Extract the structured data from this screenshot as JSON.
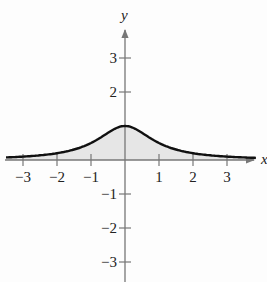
{
  "chart_data": {
    "type": "area",
    "title": "",
    "xlabel": "x",
    "ylabel": "y",
    "function": "y = 1/(1+x^2)",
    "xlim": [
      -3.5,
      3.8
    ],
    "ylim": [
      -3.6,
      3.8
    ],
    "x_ticks": [
      -3,
      -2,
      -1,
      1,
      2,
      3
    ],
    "x_tick_labels": [
      "−3",
      "−2",
      "−1",
      "1",
      "2",
      "3"
    ],
    "y_ticks": [
      3,
      2,
      -1,
      -2,
      -3
    ],
    "y_tick_labels": [
      "3",
      "2",
      "−1",
      "−2",
      "−3"
    ],
    "grid": false,
    "legend": null,
    "series": [
      {
        "name": "curve",
        "x": [
          -3.5,
          -3,
          -2.5,
          -2,
          -1.5,
          -1,
          -0.5,
          0,
          0.5,
          1,
          1.5,
          2,
          2.5,
          3,
          3.5
        ],
        "values": [
          0.075,
          0.1,
          0.138,
          0.2,
          0.308,
          0.5,
          0.8,
          1.0,
          0.8,
          0.5,
          0.308,
          0.2,
          0.138,
          0.1,
          0.075
        ],
        "fill": "shaded region between curve and x-axis"
      }
    ],
    "colors": {
      "curve": "#111111",
      "axes": "#777777",
      "fill": "#e6e6e6"
    }
  }
}
